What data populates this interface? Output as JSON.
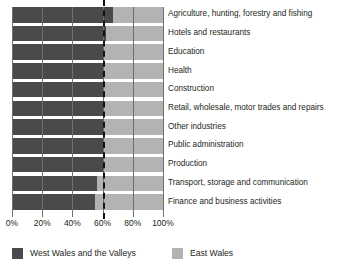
{
  "chart_data": {
    "type": "bar",
    "orientation": "horizontal",
    "stacked": true,
    "percent": true,
    "title": "",
    "subtitle": "",
    "xlabel": "",
    "ylabel": "",
    "xlim": [
      0,
      100
    ],
    "xticks": [
      0,
      20,
      40,
      60,
      80,
      100
    ],
    "xticklabels": [
      "0%",
      "20%",
      "40%",
      "60%",
      "80%",
      "100%"
    ],
    "grid": true,
    "gridlines_x": [
      0,
      20,
      40,
      60,
      80,
      100
    ],
    "reference_line": {
      "value": 60,
      "style": "dashed",
      "color": "#111111"
    },
    "legend_position": "bottom",
    "categories": [
      "Agriculture, hunting, forestry and fishing",
      "Hotels and restaurants",
      "Education",
      "Health",
      "Construction",
      "Retail, wholesale, motor trades and repairs",
      "Other industries",
      "Public administration",
      "Production",
      "Transport, storage and communication",
      "Finance and business activities"
    ],
    "series": [
      {
        "name": "West Wales and the Valleys",
        "color": "#4a4a4a",
        "values": [
          67,
          62,
          61,
          61,
          60,
          60,
          60,
          60,
          60,
          56,
          55
        ]
      },
      {
        "name": "East Wales",
        "color": "#b3b3b3",
        "values": [
          33,
          38,
          39,
          39,
          40,
          40,
          40,
          40,
          40,
          44,
          45
        ]
      }
    ]
  },
  "legend": {
    "items": [
      {
        "label": "West Wales and the Valleys",
        "color": "#4a4a4a"
      },
      {
        "label": "East Wales",
        "color": "#b3b3b3"
      }
    ]
  },
  "colors": {
    "west": "#4a4a4a",
    "east": "#b3b3b3",
    "grid": "#6f6f6f",
    "reference": "#111111",
    "background": "#ffffff",
    "text": "#231f20"
  }
}
